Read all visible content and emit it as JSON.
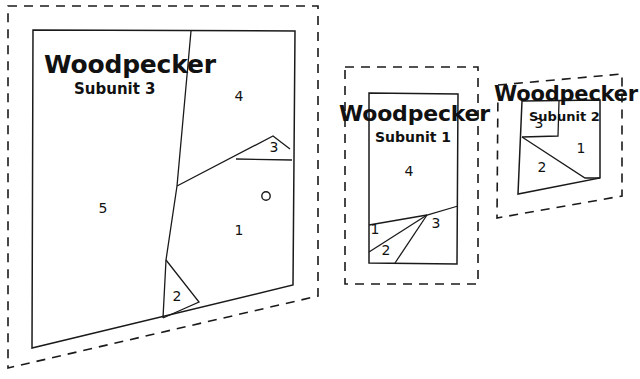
{
  "figure": {
    "kind": "forest-stand-map",
    "background_color": "#ffffff",
    "line_color": "#1a1a1a",
    "units": [
      {
        "id": "subunit-3",
        "title": "Woodpecker",
        "subtitle": "Subunit 3",
        "position": "left",
        "boundary_style": "dashed",
        "boundary_points": "8,6 318,6 318,296 8,368",
        "stand_outline_points": "33,30 295,31 293,285 32,348",
        "dividers": [
          "M 191,31 L 177,186 L 166,260 L 163,318",
          "M 177,186 L 273,136 L 290,149",
          "M 236,159 L 292,160",
          "M 166,260 L 199,302 L 163,318"
        ],
        "marker": {
          "name": "plot-center-circle",
          "cx": 266,
          "cy": 196,
          "r": 4.2
        },
        "stands": [
          {
            "label": "1",
            "x": 239,
            "y": 231
          },
          {
            "label": "2",
            "x": 177,
            "y": 297
          },
          {
            "label": "3",
            "x": 274,
            "y": 148
          },
          {
            "label": "4",
            "x": 239,
            "y": 97
          },
          {
            "label": "5",
            "x": 103,
            "y": 209
          }
        ]
      },
      {
        "id": "subunit-1",
        "title": "Woodpecker",
        "subtitle": "Subunit 1",
        "position": "middle",
        "boundary_style": "dashed",
        "boundary_points": "345,67 478,67 478,284 345,284",
        "stand_outline_points": "369,93 458,94 457,264 369,263",
        "dividers": [
          "M 369,225 L 427,215 L 458,206",
          "M 369,252 L 427,215",
          "M 395,263 L 427,215"
        ],
        "stands": [
          {
            "label": "1",
            "x": 375,
            "y": 230
          },
          {
            "label": "2",
            "x": 386,
            "y": 251
          },
          {
            "label": "3",
            "x": 436,
            "y": 224
          },
          {
            "label": "4",
            "x": 409,
            "y": 172
          }
        ]
      },
      {
        "id": "subunit-2",
        "title": "Woodpecker",
        "subtitle": "Subunit 2",
        "position": "right",
        "boundary_style": "dashed",
        "boundary_points": "498,85 622,74 622,196 497,218",
        "stand_outline_points": "522,101 600,100 600,178 518,194",
        "dividers": [
          "M 522,137 L 585,178 L 600,178",
          "M 522,137 L 558,136 L 559,101"
        ],
        "stands": [
          {
            "label": "1",
            "x": 581,
            "y": 149
          },
          {
            "label": "2",
            "x": 542,
            "y": 168
          },
          {
            "label": "3",
            "x": 539,
            "y": 124
          }
        ]
      }
    ]
  }
}
